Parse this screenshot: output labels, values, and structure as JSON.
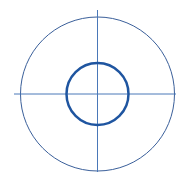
{
  "diagram": {
    "type": "concentric-circles-with-centerlines",
    "colors": {
      "outer_circle": "#3a5f9a",
      "inner_circle": "#1f55a0",
      "center_lines": "#4a78b8",
      "background": "#ffffff"
    },
    "center": {
      "x": 97.5,
      "y": 94
    },
    "outer_circle": {
      "radius": 77,
      "stroke_width": 1
    },
    "inner_circle": {
      "radius": 31,
      "stroke_width": 2.5
    },
    "horizontal_centerline": {
      "x1": 14,
      "x2": 176,
      "y": 94
    },
    "vertical_centerline": {
      "x": 97.5,
      "y1": 10,
      "y2": 172
    }
  }
}
